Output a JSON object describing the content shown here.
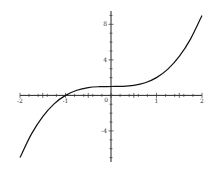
{
  "chart_data": {
    "type": "line",
    "title": "",
    "xlabel": "",
    "ylabel": "",
    "function": "x^3 + 1",
    "xlim": [
      -2,
      2
    ],
    "ylim": [
      -7.5,
      9.5
    ],
    "grid": false,
    "legend": "none",
    "x_ticks": [
      {
        "value": -2,
        "label": "-2"
      },
      {
        "value": -1,
        "label": "-1"
      },
      {
        "value": 1,
        "label": "1"
      },
      {
        "value": 2,
        "label": "2"
      }
    ],
    "y_ticks": [
      {
        "value": 8,
        "label": "8"
      },
      {
        "value": 4,
        "label": "4"
      },
      {
        "value": -4,
        "label": "-4"
      }
    ],
    "origin_label": "0",
    "series": [
      {
        "name": "y = x^3 + 1",
        "color": "#111111",
        "x": [
          -2,
          -1.75,
          -1.5,
          -1.25,
          -1,
          -0.75,
          -0.5,
          -0.25,
          0,
          0.25,
          0.5,
          0.75,
          1,
          1.25,
          1.5,
          1.75,
          2
        ],
        "y": [
          -7,
          -4.36,
          -2.38,
          -0.95,
          0,
          0.58,
          0.88,
          0.98,
          1,
          1.02,
          1.13,
          1.42,
          2,
          2.95,
          4.38,
          6.36,
          9
        ]
      }
    ]
  }
}
